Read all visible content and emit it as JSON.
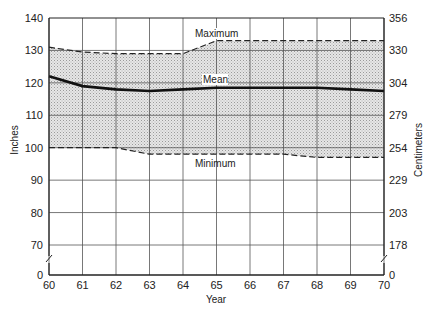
{
  "chart_data": {
    "type": "area",
    "title": "",
    "xlabel": "Year",
    "ylabel": "Inches",
    "ylabel_right": "Centimeters",
    "x": [
      60,
      61,
      62,
      63,
      64,
      65,
      66,
      67,
      68,
      69,
      70
    ],
    "series": [
      {
        "name": "Maximum",
        "style": "dashed",
        "values": [
          131,
          129.5,
          129,
          129,
          129,
          133,
          133,
          133,
          133,
          133,
          133
        ]
      },
      {
        "name": "Mean",
        "style": "solid-bold",
        "values": [
          122,
          119,
          118,
          117.5,
          118,
          118.5,
          118.5,
          118.5,
          118.5,
          118,
          117.5
        ]
      },
      {
        "name": "Minimum",
        "style": "dashed",
        "values": [
          100,
          100,
          100,
          98,
          98,
          98,
          98,
          98,
          97,
          97,
          97
        ]
      }
    ],
    "shaded_band": "between Minimum and Maximum",
    "y_ticks_left": [
      "0",
      "70",
      "80",
      "90",
      "100",
      "110",
      "120",
      "130",
      "140"
    ],
    "y_ticks_right": [
      "0",
      "178",
      "203",
      "229",
      "254",
      "279",
      "304",
      "330",
      "356"
    ],
    "x_ticks": [
      "60",
      "61",
      "62",
      "63",
      "64",
      "65",
      "66",
      "67",
      "68",
      "69",
      "70"
    ],
    "ylim": [
      70,
      140
    ],
    "axis_break": "between 0 and 70",
    "grid": true,
    "legend": "inline annotations",
    "annotations": [
      {
        "text": "Maximum",
        "near_year": 65
      },
      {
        "text": "Mean",
        "near_year": 65
      },
      {
        "text": "Minimum",
        "near_year": 64.5
      }
    ]
  },
  "labels": {
    "xlabel": "Year",
    "ylabel_left": "Inches",
    "ylabel_right": "Centimeters",
    "max_label": "Maximum",
    "mean_label": "Mean",
    "min_label": "Minimum"
  }
}
